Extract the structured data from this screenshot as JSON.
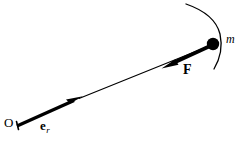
{
  "figure": {
    "type": "physics-vector-diagram",
    "background_color": "#ffffff",
    "stroke_color": "#000000",
    "width": 242,
    "height": 142
  },
  "labels": {
    "origin": "O",
    "unit_vector_base": "e",
    "unit_vector_subscript": "r",
    "force": "F",
    "mass": "m"
  },
  "geometry": {
    "origin_point": [
      17,
      126
    ],
    "mass_point": [
      213,
      44
    ],
    "mass_radius": 6,
    "unit_vector_arrow": {
      "from": [
        17,
        126
      ],
      "to": [
        82,
        97
      ],
      "style": "thick-solid-arrow"
    },
    "radial_line": {
      "from": [
        80,
        98
      ],
      "to": [
        207,
        47
      ],
      "style": "thin-solid"
    },
    "force_arrow": {
      "from": [
        208,
        47
      ],
      "to": [
        162,
        68
      ],
      "style": "thick-solid-arrow",
      "direction": "toward-origin"
    },
    "trajectory_arc": {
      "start": [
        186,
        4
      ],
      "control": [
        222,
        26
      ],
      "end": [
        214,
        69
      ],
      "style": "thin-curve"
    }
  },
  "icons": {
    "mass_marker": "filled-circle-icon",
    "unit_vector_arrowhead": "arrowhead-icon",
    "force_arrowhead": "arrowhead-icon"
  }
}
